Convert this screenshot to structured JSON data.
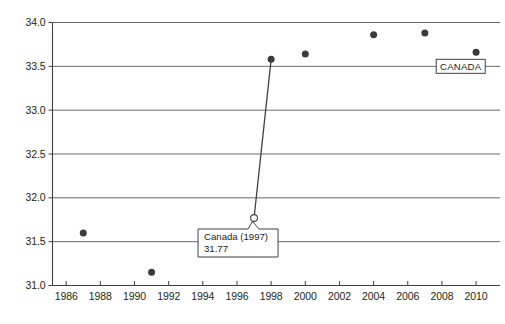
{
  "chart_data": {
    "type": "scatter",
    "title": "",
    "xlabel": "",
    "ylabel": "",
    "xlim": [
      1985.2,
      2011.4
    ],
    "ylim": [
      31.0,
      34.0
    ],
    "yticks": [
      "31.0",
      "31.5",
      "32.0",
      "32.5",
      "33.0",
      "33.5",
      "34.0"
    ],
    "ytick_values": [
      31.0,
      31.5,
      32.0,
      32.5,
      33.0,
      33.5,
      34.0
    ],
    "xticks": [
      "1986",
      "1988",
      "1990",
      "1992",
      "1994",
      "1996",
      "1998",
      "2000",
      "2002",
      "2004",
      "2006",
      "2008",
      "2010"
    ],
    "xtick_values": [
      1986,
      1988,
      1990,
      1992,
      1994,
      1996,
      1998,
      2000,
      2002,
      2004,
      2006,
      2008,
      2010
    ],
    "grid": "horizontal",
    "legend_position": "inline-right",
    "series": [
      {
        "name": "CANADA",
        "marker": "filled-circle",
        "color": "#3b3b3d",
        "points": [
          {
            "x": 1987,
            "y": 31.6
          },
          {
            "x": 1991,
            "y": 31.15
          },
          {
            "x": 1998,
            "y": 33.58
          },
          {
            "x": 2000,
            "y": 33.64
          },
          {
            "x": 2004,
            "y": 33.86
          },
          {
            "x": 2007,
            "y": 33.88
          },
          {
            "x": 2010,
            "y": 33.66
          }
        ]
      }
    ],
    "highlighted_point": {
      "x": 1997,
      "y": 31.77,
      "marker": "open-circle",
      "label_title": "Canada (1997)",
      "label_value": "31.77"
    },
    "connector": {
      "from": {
        "x": 1997,
        "y": 31.77
      },
      "to": {
        "x": 1998,
        "y": 33.58
      }
    },
    "annotations": [
      {
        "name": "series-tag",
        "text": "CANADA",
        "x": 2009.1,
        "y": 33.5
      }
    ]
  },
  "colors": {
    "axis": "#414042",
    "grid": "#58595b",
    "marker": "#3b3b3d",
    "text": "#231f20",
    "background": "#ffffff"
  },
  "caption": {
    "text": ""
  }
}
